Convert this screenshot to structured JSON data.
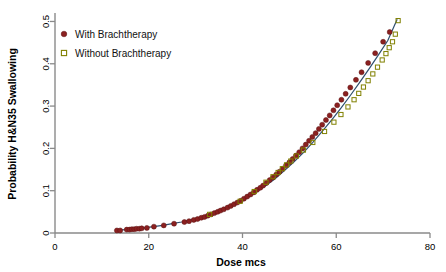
{
  "chart_data": {
    "type": "scatter",
    "title": "",
    "xlabel": "Dose mcs",
    "ylabel": "Probability H&N35 Swallowing",
    "xlim": [
      0,
      80
    ],
    "ylim": [
      0,
      0.52
    ],
    "xticks": [
      0,
      20,
      40,
      60,
      80
    ],
    "xtick_labels": [
      "0",
      "20",
      "40",
      "60",
      "80"
    ],
    "yticks": [
      0,
      0.1,
      0.2,
      0.3,
      0.4,
      0.5
    ],
    "ytick_labels": [
      "0",
      "0.1",
      "0.2",
      "0.3",
      "0.4",
      "0.5"
    ],
    "grid": false,
    "legend_position": "upper left",
    "colors": {
      "with_brachtherapy": "#8b2020",
      "without_brachtherapy": "#808000",
      "fit_line": "#2f4f6f",
      "axis": "#8a8a8a",
      "background": "#ffffff"
    },
    "legend": [
      {
        "label": "With Brachtherapy",
        "marker": "filled-circle",
        "color": "#8b2020"
      },
      {
        "label": "Without Brachtherapy",
        "marker": "open-square",
        "color": "#808000"
      }
    ],
    "fit_curve": {
      "name": "logistic fit",
      "x": [
        13,
        15,
        17,
        19,
        21,
        23,
        25,
        27,
        29,
        31,
        33,
        35,
        37,
        39,
        41,
        43,
        45,
        47,
        49,
        51,
        53,
        55,
        57,
        59,
        61,
        63,
        65,
        67,
        69,
        71,
        73
      ],
      "y": [
        0.006,
        0.008,
        0.01,
        0.012,
        0.015,
        0.018,
        0.022,
        0.026,
        0.031,
        0.037,
        0.044,
        0.052,
        0.061,
        0.071,
        0.083,
        0.097,
        0.112,
        0.129,
        0.148,
        0.168,
        0.19,
        0.214,
        0.24,
        0.267,
        0.295,
        0.325,
        0.356,
        0.388,
        0.421,
        0.455,
        0.505
      ]
    },
    "series": [
      {
        "name": "With Brachtherapy",
        "marker": "filled-circle",
        "color": "#8b2020",
        "x": [
          13.2,
          13.9,
          15.3,
          15.9,
          16.4,
          16.9,
          17.4,
          18.0,
          18.5,
          19.6,
          21.1,
          23.2,
          25.4,
          27.6,
          28.6,
          29.6,
          30.4,
          31.2,
          31.9,
          32.6,
          33.3,
          34.0,
          34.7,
          35.3,
          36.0,
          36.8,
          37.5,
          38.2,
          38.9,
          39.6,
          40.3,
          41.0,
          41.7,
          42.4,
          43.1,
          43.8,
          44.4,
          45.1,
          45.8,
          46.5,
          47.2,
          47.9,
          48.6,
          49.3,
          50.0,
          50.7,
          51.4,
          52.1,
          52.8,
          53.5,
          54.2,
          54.9,
          55.6,
          56.3,
          57.0,
          57.8,
          58.6,
          59.4,
          60.2,
          61.1,
          62.0,
          63.0,
          64.2,
          65.4,
          66.8,
          68.3,
          70.0,
          71.4
        ],
        "y": [
          0.006,
          0.006,
          0.008,
          0.008,
          0.009,
          0.009,
          0.01,
          0.01,
          0.011,
          0.012,
          0.015,
          0.018,
          0.022,
          0.026,
          0.028,
          0.031,
          0.033,
          0.036,
          0.038,
          0.041,
          0.044,
          0.047,
          0.05,
          0.053,
          0.056,
          0.06,
          0.064,
          0.068,
          0.072,
          0.076,
          0.081,
          0.086,
          0.091,
          0.096,
          0.102,
          0.107,
          0.112,
          0.118,
          0.125,
          0.131,
          0.138,
          0.145,
          0.152,
          0.16,
          0.167,
          0.175,
          0.183,
          0.191,
          0.2,
          0.209,
          0.218,
          0.227,
          0.236,
          0.246,
          0.256,
          0.267,
          0.278,
          0.29,
          0.302,
          0.315,
          0.329,
          0.344,
          0.362,
          0.38,
          0.402,
          0.425,
          0.452,
          0.475
        ]
      },
      {
        "name": "Without Brachtherapy",
        "marker": "open-square",
        "color": "#808000",
        "x": [
          33.0,
          39.5,
          42.5,
          45.0,
          46.5,
          47.6,
          48.5,
          49.4,
          50.3,
          51.5,
          53.0,
          55.0,
          57.5,
          59.5,
          61.0,
          62.5,
          63.8,
          64.8,
          65.8,
          66.8,
          67.8,
          68.8,
          69.8,
          70.6,
          71.3,
          72.0,
          72.6,
          73.2
        ],
        "y": [
          0.044,
          0.075,
          0.098,
          0.12,
          0.133,
          0.143,
          0.152,
          0.161,
          0.17,
          0.182,
          0.196,
          0.214,
          0.24,
          0.262,
          0.28,
          0.298,
          0.315,
          0.33,
          0.345,
          0.36,
          0.376,
          0.392,
          0.409,
          0.424,
          0.438,
          0.452,
          0.47,
          0.502
        ]
      }
    ]
  }
}
